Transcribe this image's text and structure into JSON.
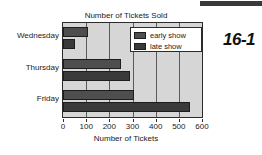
{
  "page_marker": "16-1",
  "chart_data": {
    "type": "bar",
    "orientation": "horizontal",
    "title": "Number of Tickets Sold",
    "xlabel": "Number of Tickets",
    "ylabel": "",
    "categories": [
      "Wednesday",
      "Thursday",
      "Friday"
    ],
    "series": [
      {
        "name": "early show",
        "values": [
          110,
          250,
          305
        ],
        "color": "#4e4e4e"
      },
      {
        "name": "late show",
        "values": [
          50,
          290,
          550
        ],
        "color": "#3a3a3a"
      }
    ],
    "xlim": [
      0,
      600
    ],
    "xticks": [
      0,
      100,
      200,
      300,
      400,
      500,
      600
    ],
    "xtick_labels": [
      "0",
      "100",
      "200",
      "300",
      "400",
      "500",
      "600"
    ],
    "grid": true,
    "grid_axis": "x",
    "legend_position": "top-right",
    "plot_background": "#d6d6d6",
    "figure_background": "#ffffff"
  }
}
